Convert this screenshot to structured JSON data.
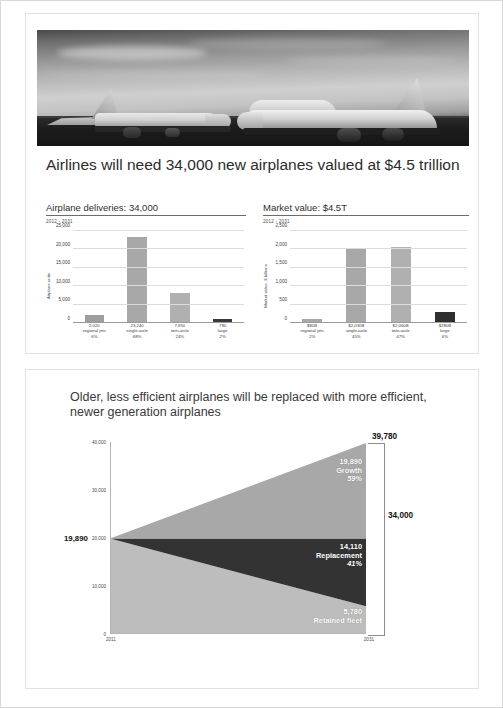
{
  "slide1": {
    "photo_alt": "two-boeing-airplanes-on-runway",
    "title": "Airlines will need 34,000 new airplanes valued at $4.5 trillion",
    "charts": [
      {
        "heading": "Airplane deliveries: 34,000",
        "subtitle": "2012 - 2031",
        "ylabel": "Airplane units"
      },
      {
        "heading": "Market value: $4.5T",
        "subtitle": "2012 - 2031",
        "ylabel": "Market value, $ billions"
      }
    ]
  },
  "slide2": {
    "title": "Older, less efficient airplanes will be replaced with more efficient, newer generation airplanes",
    "left_value": "19,890",
    "bracket_top_value": "39,780",
    "bracket_total_value": "34,000",
    "segments": [
      {
        "value": "19,890",
        "name": "Growth",
        "pct": "59%"
      },
      {
        "value": "14,110",
        "name": "Replacement",
        "pct": "41%"
      },
      {
        "value": "5,780",
        "name": "Retained fleet",
        "pct": ""
      }
    ]
  },
  "colors": {
    "bar_light": "#a8a8a8",
    "bar_dark": "#3a3a3a",
    "band_growth": "#a8a8a8",
    "band_replacement": "#333333",
    "band_retained": "#bdbdbd",
    "grid": "#dcdcdc",
    "axis": "#9a9a9a",
    "text": "#2c2c2c"
  },
  "chart_data": [
    {
      "type": "bar",
      "title": "Airplane deliveries: 34,000",
      "subtitle": "2012 - 2031",
      "xlabel": "",
      "ylabel": "Airplane units",
      "ylim": [
        0,
        25000
      ],
      "yticks": [
        0,
        5000,
        10000,
        15000,
        20000,
        25000
      ],
      "ytick_labels": [
        "0",
        "5,000",
        "10,000",
        "15,000",
        "20,000",
        "25,000"
      ],
      "grid": true,
      "legend": "none",
      "categories": [
        "regional jets",
        "single-aisle",
        "twin-aisle",
        "large"
      ],
      "values": [
        2020,
        23240,
        7950,
        790
      ],
      "value_labels": [
        "2,020",
        "23,240",
        "7,950",
        "790"
      ],
      "share_labels": [
        "6%",
        "68%",
        "24%",
        "2%"
      ],
      "bar_colors": [
        "#9e9e9e",
        "#a8a8a8",
        "#b0b0b0",
        "#3a3a3a"
      ]
    },
    {
      "type": "bar",
      "title": "Market value: $4.5T",
      "subtitle": "2012 - 2031",
      "xlabel": "",
      "ylabel": "Market value, $ billions",
      "ylim": [
        0,
        2500
      ],
      "yticks": [
        0,
        500,
        1000,
        1500,
        2000,
        2500
      ],
      "ytick_labels": [
        "0",
        "500",
        "1,000",
        "1,500",
        "2,000",
        "2,500"
      ],
      "grid": true,
      "legend": "none",
      "categories": [
        "regional jets",
        "single-aisle",
        "twin-aisle",
        "large"
      ],
      "values": [
        80,
        2030,
        2060,
        280
      ],
      "value_labels": [
        "$80B",
        "$2,030B",
        "$2,060B",
        "$280B"
      ],
      "share_labels": [
        "2%",
        "45%",
        "47%",
        "6%"
      ],
      "bar_colors": [
        "#a8a8a8",
        "#a8a8a8",
        "#b0b0b0",
        "#2f2f2f"
      ]
    },
    {
      "type": "area",
      "title": "Older, less efficient airplanes will be replaced with more efficient, newer generation airplanes",
      "xlabel": "",
      "ylabel": "",
      "x": [
        2011,
        2031
      ],
      "xtick_labels": [
        "2011",
        "2031"
      ],
      "ylim": [
        0,
        40000
      ],
      "yticks": [
        0,
        10000,
        20000,
        30000,
        40000
      ],
      "ytick_labels": [
        "0",
        "10,000",
        "20,000",
        "30,000",
        "40,000"
      ],
      "grid": false,
      "legend": "in-chart",
      "stack_note": "2011 fleet = 19,890; 2031 fleet = 39,780; new deliveries 2012-2031 = 34,000",
      "series": [
        {
          "name": "Retained fleet",
          "values": [
            19890,
            5780
          ],
          "color": "#bdbdbd",
          "label": "5,780"
        },
        {
          "name": "Replacement",
          "values": [
            0,
            14110
          ],
          "color": "#333333",
          "label": "14,110",
          "pct": "41%"
        },
        {
          "name": "Growth",
          "values": [
            0,
            19890
          ],
          "color": "#a8a8a8",
          "label": "19,890",
          "pct": "59%"
        }
      ],
      "annotations": [
        {
          "text": "19,890",
          "position": "left-axis-2011"
        },
        {
          "text": "39,780",
          "position": "right-top-2031"
        },
        {
          "text": "34,000",
          "position": "right-bracket-total"
        }
      ]
    }
  ]
}
